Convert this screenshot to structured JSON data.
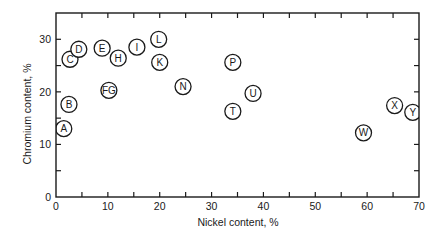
{
  "chart_data": {
    "type": "scatter",
    "title": "",
    "xlabel": "Nickel content, %",
    "ylabel": "Chromium content, %",
    "xlim": [
      0,
      70
    ],
    "ylim": [
      0,
      35
    ],
    "x_ticks": [
      0,
      10,
      20,
      30,
      40,
      50,
      60,
      70
    ],
    "x_minor_ticks": [
      5,
      15,
      25,
      35,
      45,
      55,
      65
    ],
    "y_ticks": [
      0,
      10,
      20,
      30
    ],
    "y_minor_ticks": [
      5,
      15,
      25
    ],
    "grid": false,
    "legend": "none",
    "marker": "labeled-circle",
    "points": [
      {
        "label": "A",
        "x": 1.5,
        "y": 13.0
      },
      {
        "label": "B",
        "x": 2.5,
        "y": 17.6
      },
      {
        "label": "C",
        "x": 2.7,
        "y": 26.2
      },
      {
        "label": "D",
        "x": 4.4,
        "y": 28.1
      },
      {
        "label": "E",
        "x": 8.9,
        "y": 28.3
      },
      {
        "label": "FG",
        "x": 10.2,
        "y": 20.3
      },
      {
        "label": "H",
        "x": 12.0,
        "y": 26.4
      },
      {
        "label": "I",
        "x": 15.6,
        "y": 28.5
      },
      {
        "label": "L",
        "x": 19.8,
        "y": 30.0
      },
      {
        "label": "K",
        "x": 20.0,
        "y": 25.6
      },
      {
        "label": "N",
        "x": 24.5,
        "y": 21.0
      },
      {
        "label": "P",
        "x": 34.1,
        "y": 25.6
      },
      {
        "label": "T",
        "x": 34.1,
        "y": 16.3
      },
      {
        "label": "U",
        "x": 38.0,
        "y": 19.7
      },
      {
        "label": "W",
        "x": 59.3,
        "y": 12.2
      },
      {
        "label": "X",
        "x": 65.3,
        "y": 17.4
      },
      {
        "label": "Y",
        "x": 68.8,
        "y": 16.1
      }
    ]
  },
  "colors": {
    "ink": "#1a1a1a",
    "background": "#ffffff"
  }
}
